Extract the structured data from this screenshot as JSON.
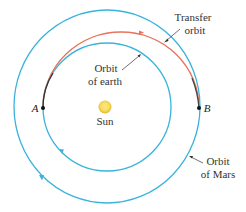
{
  "diagram": {
    "type": "orbital-transfer",
    "labels": {
      "transfer_line1": "Transfer",
      "transfer_line2": "orbit",
      "earth_line1": "Orbit",
      "earth_line2": "of earth",
      "mars_line1": "Orbit",
      "mars_line2": "of Mars",
      "sun": "Sun",
      "point_a": "A",
      "point_b": "B"
    },
    "colors": {
      "orbit": "#3ab3dc",
      "transfer": "#e8735a",
      "overlap": "#333333",
      "sun_core": "#f7dc5c",
      "sun_edge": "#e6b52a",
      "text": "#333333"
    },
    "elements": {
      "sun": {
        "cx": 105,
        "cy": 107,
        "r": 6
      },
      "earth_orbit": {
        "cx": 107,
        "cy": 107,
        "r": 64
      },
      "mars_orbit": {
        "cx": 107,
        "cy": 107,
        "rx": 93,
        "ry": 96
      },
      "transfer_orbit": {
        "from": "A",
        "to": "B",
        "apex_y": 32
      },
      "point_a": {
        "x": 43,
        "y": 108
      },
      "point_b": {
        "x": 199,
        "y": 108
      }
    }
  }
}
